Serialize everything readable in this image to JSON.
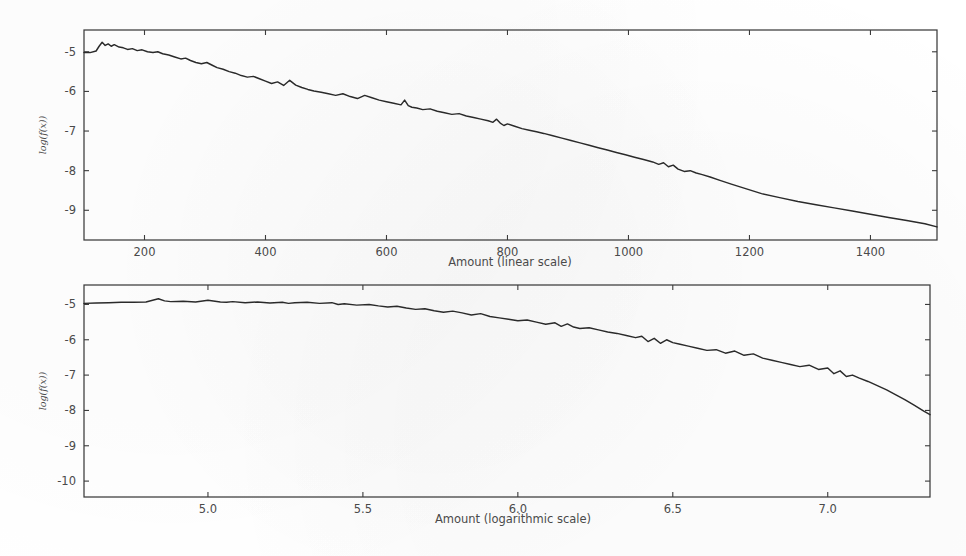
{
  "figure": {
    "background_color": "#ffffff",
    "line_color": "#2a2a2a",
    "axis_color": "#3b3b3b",
    "tick_label_color": "#4a4a4a"
  },
  "chart_data": [
    {
      "id": "top",
      "type": "line",
      "title": "",
      "xlabel": "Amount (linear scale)",
      "ylabel": "log(f(x))",
      "grid": false,
      "legend": "none",
      "xlim": [
        100,
        1510
      ],
      "ylim": [
        -9.75,
        -4.45
      ],
      "xticks": [
        200,
        400,
        600,
        800,
        1000,
        1200,
        1400
      ],
      "xtick_labels": [
        "200",
        "400",
        "600",
        "800",
        "1000",
        "1200",
        "1400"
      ],
      "yticks": [
        -5,
        -6,
        -7,
        -8,
        -9
      ],
      "ytick_labels": [
        "-5",
        "-6",
        "-7",
        "-8",
        "-9"
      ],
      "x": [
        100,
        110,
        120,
        125,
        130,
        135,
        140,
        145,
        150,
        158,
        165,
        172,
        180,
        188,
        196,
        205,
        214,
        222,
        230,
        240,
        250,
        260,
        268,
        276,
        285,
        294,
        303,
        312,
        320,
        330,
        340,
        350,
        360,
        370,
        380,
        390,
        400,
        410,
        420,
        430,
        440,
        450,
        460,
        470,
        480,
        492,
        504,
        516,
        528,
        540,
        552,
        564,
        576,
        588,
        600,
        612,
        624,
        630,
        636,
        642,
        650,
        660,
        672,
        684,
        696,
        708,
        720,
        732,
        744,
        756,
        768,
        776,
        782,
        788,
        794,
        800,
        812,
        824,
        836,
        848,
        860,
        875,
        890,
        905,
        920,
        935,
        950,
        965,
        980,
        995,
        1010,
        1025,
        1040,
        1050,
        1058,
        1066,
        1074,
        1082,
        1092,
        1102,
        1112,
        1122,
        1135,
        1150,
        1170,
        1195,
        1220,
        1250,
        1280,
        1310,
        1340,
        1370,
        1400,
        1430,
        1460,
        1490,
        1510
      ],
      "y": [
        -5.02,
        -5.02,
        -4.98,
        -4.86,
        -4.76,
        -4.84,
        -4.8,
        -4.86,
        -4.82,
        -4.88,
        -4.9,
        -4.94,
        -4.92,
        -4.97,
        -4.95,
        -5.0,
        -5.02,
        -5.0,
        -5.05,
        -5.08,
        -5.13,
        -5.18,
        -5.16,
        -5.22,
        -5.27,
        -5.3,
        -5.27,
        -5.34,
        -5.4,
        -5.44,
        -5.5,
        -5.54,
        -5.6,
        -5.64,
        -5.62,
        -5.68,
        -5.74,
        -5.8,
        -5.76,
        -5.85,
        -5.72,
        -5.84,
        -5.9,
        -5.95,
        -5.99,
        -6.02,
        -6.06,
        -6.1,
        -6.06,
        -6.13,
        -6.18,
        -6.1,
        -6.16,
        -6.22,
        -6.26,
        -6.3,
        -6.34,
        -6.22,
        -6.36,
        -6.4,
        -6.42,
        -6.46,
        -6.44,
        -6.5,
        -6.54,
        -6.58,
        -6.56,
        -6.62,
        -6.66,
        -6.7,
        -6.74,
        -6.78,
        -6.7,
        -6.8,
        -6.86,
        -6.82,
        -6.88,
        -6.94,
        -6.98,
        -7.02,
        -7.06,
        -7.12,
        -7.18,
        -7.24,
        -7.3,
        -7.36,
        -7.42,
        -7.48,
        -7.54,
        -7.6,
        -7.66,
        -7.72,
        -7.78,
        -7.84,
        -7.8,
        -7.9,
        -7.86,
        -7.96,
        -8.02,
        -8.0,
        -8.06,
        -8.1,
        -8.16,
        -8.24,
        -8.34,
        -8.46,
        -8.58,
        -8.68,
        -8.78,
        -8.86,
        -8.94,
        -9.02,
        -9.1,
        -9.18,
        -9.26,
        -9.34,
        -9.42
      ]
    },
    {
      "id": "bottom",
      "type": "line",
      "title": "",
      "xlabel": "Amount (logarithmic scale)",
      "ylabel": "log(f(x))",
      "grid": false,
      "legend": "none",
      "xlim": [
        4.6,
        7.33
      ],
      "ylim": [
        -10.45,
        -4.45
      ],
      "xticks": [
        5.0,
        5.5,
        6.0,
        6.5,
        7.0
      ],
      "xtick_labels": [
        "5.0",
        "5.5",
        "6.0",
        "6.5",
        "7.0"
      ],
      "yticks": [
        -5,
        -6,
        -7,
        -8,
        -9,
        -10
      ],
      "ytick_labels": [
        "-5",
        "-6",
        "-7",
        "-8",
        "-9",
        "-10"
      ],
      "x": [
        4.6,
        4.64,
        4.68,
        4.72,
        4.76,
        4.8,
        4.84,
        4.86,
        4.88,
        4.92,
        4.96,
        5.0,
        5.04,
        5.06,
        5.08,
        5.12,
        5.16,
        5.2,
        5.24,
        5.26,
        5.28,
        5.32,
        5.36,
        5.4,
        5.42,
        5.44,
        5.48,
        5.52,
        5.55,
        5.58,
        5.61,
        5.64,
        5.67,
        5.7,
        5.73,
        5.76,
        5.79,
        5.82,
        5.85,
        5.88,
        5.91,
        5.94,
        5.97,
        6.0,
        6.03,
        6.06,
        6.09,
        6.12,
        6.14,
        6.16,
        6.18,
        6.2,
        6.23,
        6.26,
        6.29,
        6.32,
        6.35,
        6.38,
        6.4,
        6.42,
        6.44,
        6.46,
        6.48,
        6.5,
        6.52,
        6.55,
        6.58,
        6.61,
        6.64,
        6.67,
        6.7,
        6.73,
        6.76,
        6.79,
        6.82,
        6.85,
        6.88,
        6.91,
        6.94,
        6.97,
        7.0,
        7.02,
        7.04,
        7.06,
        7.08,
        7.1,
        7.13,
        7.16,
        7.19,
        7.22,
        7.25,
        7.28,
        7.31,
        7.33
      ],
      "y": [
        -4.97,
        -4.96,
        -4.95,
        -4.94,
        -4.94,
        -4.93,
        -4.84,
        -4.9,
        -4.92,
        -4.91,
        -4.93,
        -4.88,
        -4.93,
        -4.94,
        -4.92,
        -4.95,
        -4.93,
        -4.96,
        -4.94,
        -4.97,
        -4.95,
        -4.94,
        -4.97,
        -4.95,
        -5.0,
        -4.98,
        -5.02,
        -5.0,
        -5.04,
        -5.07,
        -5.05,
        -5.1,
        -5.14,
        -5.12,
        -5.18,
        -5.22,
        -5.19,
        -5.24,
        -5.3,
        -5.26,
        -5.34,
        -5.38,
        -5.42,
        -5.46,
        -5.44,
        -5.5,
        -5.56,
        -5.52,
        -5.62,
        -5.55,
        -5.64,
        -5.68,
        -5.66,
        -5.72,
        -5.78,
        -5.82,
        -5.88,
        -5.94,
        -5.9,
        -6.05,
        -5.96,
        -6.1,
        -6.0,
        -6.08,
        -6.12,
        -6.18,
        -6.24,
        -6.3,
        -6.28,
        -6.38,
        -6.32,
        -6.44,
        -6.4,
        -6.52,
        -6.58,
        -6.64,
        -6.7,
        -6.76,
        -6.72,
        -6.84,
        -6.8,
        -6.96,
        -6.88,
        -7.04,
        -7.0,
        -7.08,
        -7.18,
        -7.3,
        -7.42,
        -7.56,
        -7.7,
        -7.86,
        -8.02,
        -8.12
      ]
    }
  ]
}
